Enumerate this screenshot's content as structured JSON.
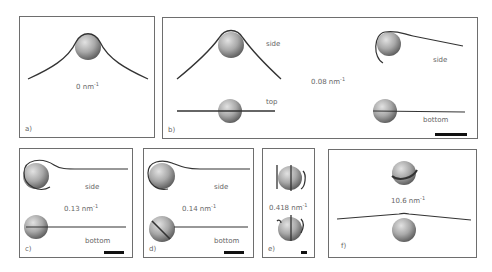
{
  "figure": {
    "panels": [
      {
        "id": "a",
        "label": "a)",
        "curvature": "0",
        "unit": "nm",
        "exp": "-1",
        "views": []
      },
      {
        "id": "b",
        "label": "b)",
        "curvature": "0.08",
        "unit": "nm",
        "exp": "-1",
        "views": [
          "side",
          "top",
          "side",
          "bottom"
        ]
      },
      {
        "id": "c",
        "label": "c)",
        "curvature": "0.13",
        "unit": "nm",
        "exp": "-1",
        "views": [
          "side",
          "bottom"
        ]
      },
      {
        "id": "d",
        "label": "d)",
        "curvature": "0.14",
        "unit": "nm",
        "exp": "-1",
        "views": [
          "side",
          "bottom"
        ]
      },
      {
        "id": "e",
        "label": "e)",
        "curvature": "0.418",
        "unit": "nm",
        "exp": "-1",
        "views": []
      },
      {
        "id": "f",
        "label": "f)",
        "curvature": "10.6",
        "unit": "nm",
        "exp": "-1",
        "views": []
      }
    ],
    "colors": {
      "frame": "#6e6e6e",
      "sphere_light": "#d8d8d8",
      "sphere_dark": "#6a6a6a",
      "polymer": "#333333",
      "scalebar": "#111111"
    }
  }
}
